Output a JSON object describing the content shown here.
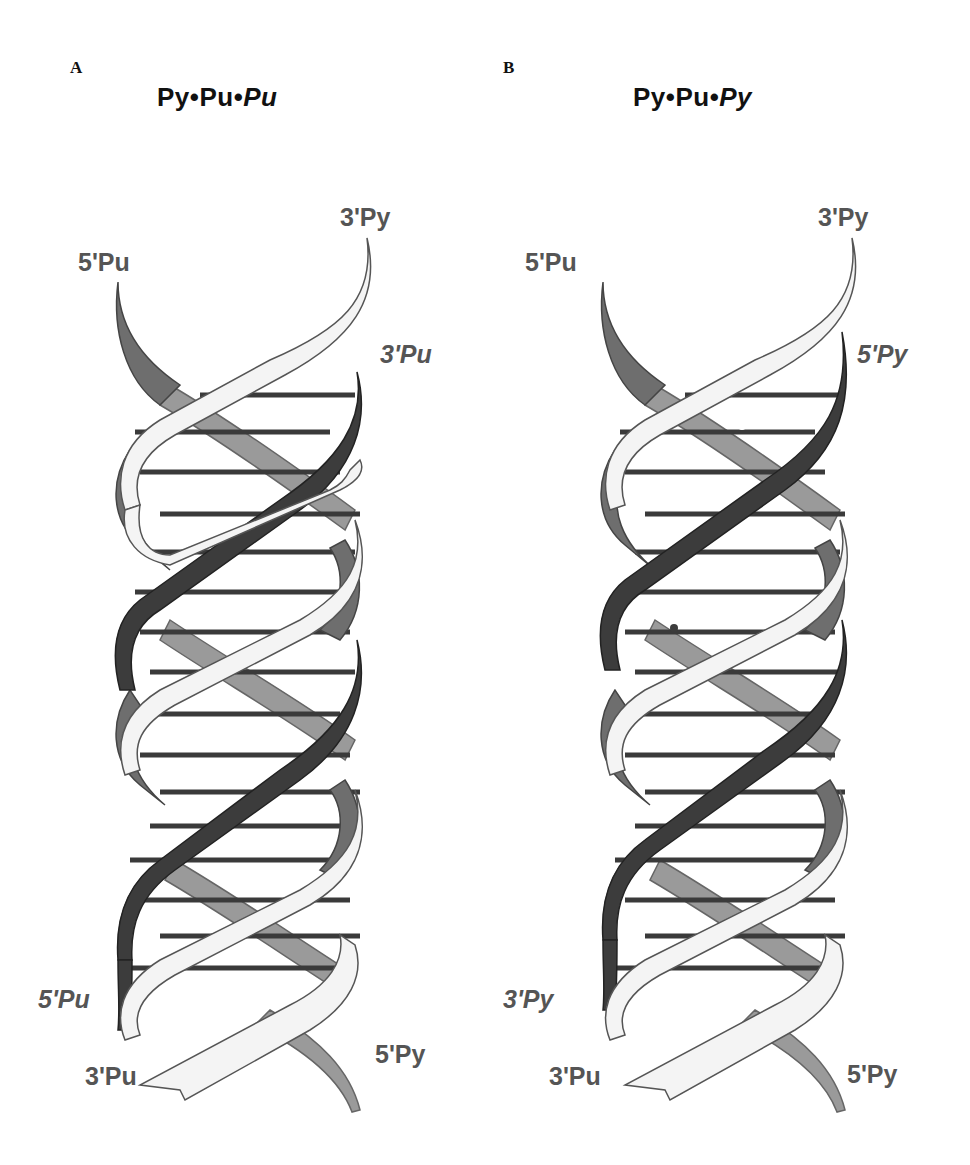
{
  "figure": {
    "panels": [
      {
        "letter": "A",
        "title": {
          "part1": "Py",
          "sep1": "•",
          "part2": "Pu",
          "sep2": "•",
          "part3": "Pu"
        },
        "labels": {
          "top_left": "5'Pu",
          "top_right": "3'Py",
          "third_top": "3'Pu",
          "third_bottom": "5'Pu",
          "bottom_left": "3'Pu",
          "bottom_right": "5'Py"
        },
        "dots": []
      },
      {
        "letter": "B",
        "title": {
          "part1": "Py",
          "sep1": "•",
          "part2": "Pu",
          "sep2": "•",
          "part3": "Py"
        },
        "labels": {
          "top_left": "5'Pu",
          "top_right": "3'Py",
          "third_top": "5'Py",
          "third_bottom": "3'Py",
          "bottom_left": "3'Pu",
          "bottom_right": "5'Py"
        },
        "dots": [
          {
            "x": 742,
            "y": 426,
            "color": "white"
          },
          {
            "x": 674,
            "y": 628,
            "color": "dark"
          },
          {
            "x": 727,
            "y": 833,
            "color": "white"
          }
        ]
      }
    ],
    "colors": {
      "py_strand_fill": "#f4f4f4",
      "pu_strand_fill": "#6e6e6e",
      "third_strand_fill": "#3c3c3c",
      "back_strand_fill": "#9a9a9a",
      "rung": "#3a3a3a",
      "outline": "#555555",
      "label": "#555555"
    }
  }
}
